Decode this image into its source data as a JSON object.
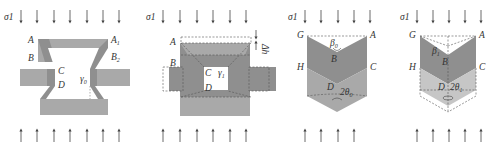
{
  "figure": {
    "panels": [
      {
        "id": "a",
        "stress_label": "σ1",
        "labels": {
          "A": "A",
          "A1": "A",
          "A1_sub": "1",
          "B": "B",
          "B2": "B",
          "B2_sub": "2",
          "C": "C",
          "D": "D",
          "angle": "γ",
          "angle_sub": "0"
        }
      },
      {
        "id": "b",
        "stress_label": "σ1",
        "labels": {
          "A": "A",
          "B": "B",
          "C": "C",
          "D": "D",
          "angle": "γ",
          "angle_sub": "1",
          "displacement": "Δh"
        }
      },
      {
        "id": "c",
        "stress_label": "σ1",
        "labels": {
          "G": "G",
          "A": "A",
          "H": "H",
          "C": "C",
          "B": "B",
          "D": "D",
          "beta": "β",
          "beta_sub": "0",
          "theta": "2θ",
          "theta_sub": "0"
        }
      },
      {
        "id": "d",
        "stress_label": "σ1",
        "labels": {
          "G": "G",
          "A": "A",
          "H": "H",
          "C": "C",
          "B": "B",
          "D": "D",
          "beta": "β",
          "beta_sub": "1",
          "theta": "2θ",
          "theta_sub": "1"
        }
      }
    ],
    "colors": {
      "dark_gray": "#8f8f8f",
      "mid_gray": "#a9a9a9",
      "light_gray": "#c6c6c6",
      "dashed": "#555555",
      "arrow": "#444444"
    }
  }
}
